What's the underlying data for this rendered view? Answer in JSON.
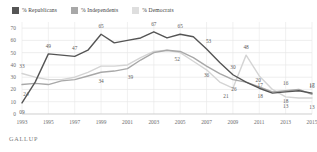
{
  "chart_data": {
    "type": "line",
    "title": "",
    "subtitle": "",
    "xlabel": "",
    "ylabel": "",
    "grid": true,
    "legend_position": "top-left",
    "ylim": [
      0,
      75
    ],
    "yticks": [
      0,
      10,
      20,
      30,
      40,
      50,
      60,
      70
    ],
    "x": [
      1993,
      1994,
      1995,
      1996,
      1997,
      1998,
      1999,
      2000,
      2001,
      2002,
      2003,
      2004,
      2005,
      2006,
      2007,
      2008,
      2009,
      2010,
      2011,
      2012,
      2013,
      2014,
      2015
    ],
    "xticks": [
      1993,
      1995,
      1997,
      1999,
      2001,
      2003,
      2005,
      2007,
      2009,
      2011,
      2013,
      2015
    ],
    "series": [
      {
        "name": "% Republicans",
        "color": "#555555",
        "values": [
          9,
          26,
          49,
          48,
          47,
          52,
          65,
          58,
          60,
          62,
          67,
          62,
          65,
          63,
          53,
          42,
          32,
          26,
          21,
          17,
          18,
          19,
          17
        ]
      },
      {
        "name": "% Independents",
        "color": "#a8a8a8",
        "values": [
          24,
          25,
          24,
          27,
          28,
          31,
          34,
          35,
          37,
          44,
          50,
          52,
          51,
          46,
          39,
          33,
          28,
          26,
          22,
          18,
          19,
          20,
          16
        ]
      },
      {
        "name": "% Democrats",
        "color": "#d4d4d4",
        "values": [
          33,
          30,
          28,
          28,
          30,
          34,
          39,
          39,
          40,
          46,
          51,
          52,
          50,
          43,
          36,
          26,
          21,
          48,
          31,
          20,
          14,
          13,
          13
        ]
      }
    ],
    "point_labels": [
      {
        "series": "% Republicans",
        "x": 1993,
        "value": "09",
        "dx": 0,
        "dy": 9
      },
      {
        "series": "% Republicans",
        "x": 1995,
        "value": "49",
        "dx": 0,
        "dy": -8
      },
      {
        "series": "% Republicans",
        "x": 1997,
        "value": "47",
        "dx": 0,
        "dy": -8
      },
      {
        "series": "% Republicans",
        "x": 1999,
        "value": "65",
        "dx": 0,
        "dy": -8
      },
      {
        "series": "% Republicans",
        "x": 2003,
        "value": "67",
        "dx": 0,
        "dy": -8
      },
      {
        "series": "% Republicans",
        "x": 2005,
        "value": "65",
        "dx": 0,
        "dy": -8
      },
      {
        "series": "% Republicans",
        "x": 2007,
        "value": "53",
        "dx": 2,
        "dy": -8
      },
      {
        "series": "% Republicans",
        "x": 2009,
        "value": "30",
        "dx": 0,
        "dy": -8
      },
      {
        "series": "% Republicans",
        "x": 2011,
        "value": "20",
        "dx": -1,
        "dy": -8
      },
      {
        "series": "% Republicans",
        "x": 2013,
        "value": "18",
        "dx": 0,
        "dy": 9
      },
      {
        "series": "% Republicans",
        "x": 2015,
        "value": "17",
        "dx": 0,
        "dy": -8
      },
      {
        "series": "% Independents",
        "x": 1993,
        "value": "24",
        "dx": 4,
        "dy": 9
      },
      {
        "series": "% Independents",
        "x": 1999,
        "value": "34",
        "dx": 0,
        "dy": 9
      },
      {
        "series": "% Independents",
        "x": 2001,
        "value": "39",
        "dx": 3,
        "dy": 8
      },
      {
        "series": "% Independents",
        "x": 2005,
        "value": "52",
        "dx": -3,
        "dy": 8
      },
      {
        "series": "% Independents",
        "x": 2007,
        "value": "36",
        "dx": 0,
        "dy": 9
      },
      {
        "series": "% Independents",
        "x": 2009,
        "value": "26",
        "dx": 1,
        "dy": 9
      },
      {
        "series": "% Independents",
        "x": 2011,
        "value": "18",
        "dx": 1,
        "dy": 9
      },
      {
        "series": "% Independents",
        "x": 2013,
        "value": "16",
        "dx": 0,
        "dy": -8
      },
      {
        "series": "% Independents",
        "x": 2015,
        "value": "16",
        "dx": 0,
        "dy": -8
      },
      {
        "series": "% Democrats",
        "x": 1993,
        "value": "33",
        "dx": 0,
        "dy": -8
      },
      {
        "series": "% Democrats",
        "x": 2009,
        "value": "21",
        "dx": -7,
        "dy": 8
      },
      {
        "series": "% Democrats",
        "x": 2010,
        "value": "48",
        "dx": 0,
        "dy": -8
      },
      {
        "series": "% Democrats",
        "x": 2011,
        "value": "17",
        "dx": 1,
        "dy": 9
      },
      {
        "series": "% Democrats",
        "x": 2013,
        "value": "13",
        "dx": 0,
        "dy": 9
      },
      {
        "series": "% Democrats",
        "x": 2015,
        "value": "13",
        "dx": 0,
        "dy": 9
      }
    ]
  },
  "legend": {
    "items": [
      {
        "label": "% Republicans",
        "color": "#555555"
      },
      {
        "label": "% Independents",
        "color": "#a8a8a8"
      },
      {
        "label": "% Democrats",
        "color": "#dedede"
      }
    ]
  },
  "footer": {
    "brand": "GALLUP"
  }
}
